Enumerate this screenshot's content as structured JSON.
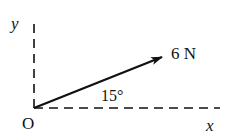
{
  "figure": {
    "origin_label": "O",
    "x_axis_label": "x",
    "y_axis_label": "y",
    "force_label": "6 N",
    "angle_label": "15°",
    "force_magnitude_N": 6,
    "angle_deg": 15,
    "colors": {
      "ink": "#111111",
      "background": "#ffffff"
    }
  }
}
